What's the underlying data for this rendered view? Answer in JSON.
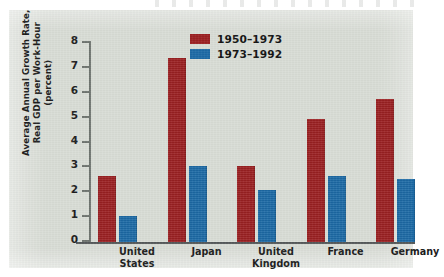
{
  "chart_data": {
    "type": "bar",
    "title": "",
    "xlabel": "",
    "ylabel": "Average Annual Growth Rate, Real GDP per Work-Hour (percent)",
    "ylabel_lines": [
      "Average Annual Growth Rate,",
      "Real GDP per Work-Hour",
      "(percent)"
    ],
    "categories": [
      "United States",
      "Japan",
      "United Kingdom",
      "France",
      "Germany"
    ],
    "category_lines": [
      [
        "United",
        "States"
      ],
      [
        "Japan"
      ],
      [
        "United",
        "Kingdom"
      ],
      [
        "France"
      ],
      [
        "Germany"
      ]
    ],
    "series": [
      {
        "name": "1950–1973",
        "color": "#9b2022",
        "values": [
          2.65,
          7.4,
          3.05,
          4.95,
          5.75
        ]
      },
      {
        "name": "1973–1992",
        "color": "#1c6aa6",
        "values": [
          1.05,
          3.05,
          2.1,
          2.65,
          2.55
        ]
      }
    ],
    "ylim": [
      0,
      8
    ],
    "yticks": [
      0,
      1,
      2,
      3,
      4,
      5,
      6,
      7,
      8
    ],
    "ytick_labels": [
      "0",
      "1",
      "2",
      "3",
      "4",
      "5",
      "6",
      "7",
      "8"
    ],
    "grid": false,
    "legend_position": "top-center",
    "background_color": "#d9ddd6"
  }
}
